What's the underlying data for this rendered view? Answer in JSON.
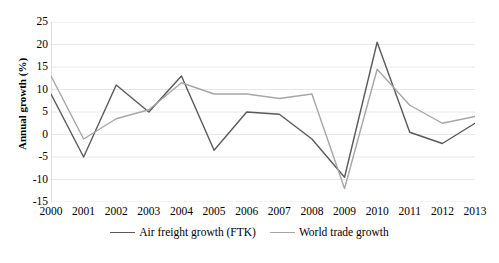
{
  "chart_data": {
    "type": "line",
    "title": "",
    "xlabel": "",
    "ylabel": "Annual growth (%)",
    "categories": [
      "2000",
      "2001",
      "2002",
      "2003",
      "2004",
      "2005",
      "2006",
      "2007",
      "2008",
      "2009",
      "2010",
      "2011",
      "2012",
      "2013"
    ],
    "x": [
      2000,
      2001,
      2002,
      2003,
      2004,
      2005,
      2006,
      2007,
      2008,
      2009,
      2010,
      2011,
      2012,
      2013
    ],
    "ylim": [
      -15,
      25
    ],
    "yticks": [
      -15,
      -10,
      -5,
      0,
      5,
      10,
      15,
      20,
      25
    ],
    "grid": "horizontal",
    "legend_position": "bottom",
    "series": [
      {
        "name": "Air freight growth (FTK)",
        "color": "#595959",
        "values": [
          9.0,
          -5.0,
          11.0,
          5.0,
          13.0,
          -3.5,
          5.0,
          4.5,
          -1.0,
          -9.5,
          20.5,
          0.5,
          -2.0,
          2.5
        ]
      },
      {
        "name": "World trade growth",
        "color": "#a6a6a6",
        "values": [
          13.0,
          -1.0,
          3.5,
          5.5,
          11.5,
          9.0,
          9.0,
          8.0,
          9.0,
          -12.0,
          14.5,
          6.5,
          2.5,
          4.0
        ]
      }
    ]
  },
  "axis": {
    "y_title": "Annual growth (%)",
    "y_tick_labels": [
      "25",
      "20",
      "15",
      "10",
      "5",
      "0",
      "-5",
      "-10",
      "-15"
    ]
  },
  "legend": {
    "items": [
      {
        "label": "Air freight growth (FTK)",
        "color": "#595959"
      },
      {
        "label": "World trade growth",
        "color": "#a6a6a6"
      }
    ]
  },
  "caption": {
    "text": ""
  },
  "colors": {
    "gridline": "#e8e8e8",
    "axis_line": "#bfbfbf",
    "series_dark": "#595959",
    "series_light": "#a6a6a6",
    "background": "#ffffff"
  }
}
